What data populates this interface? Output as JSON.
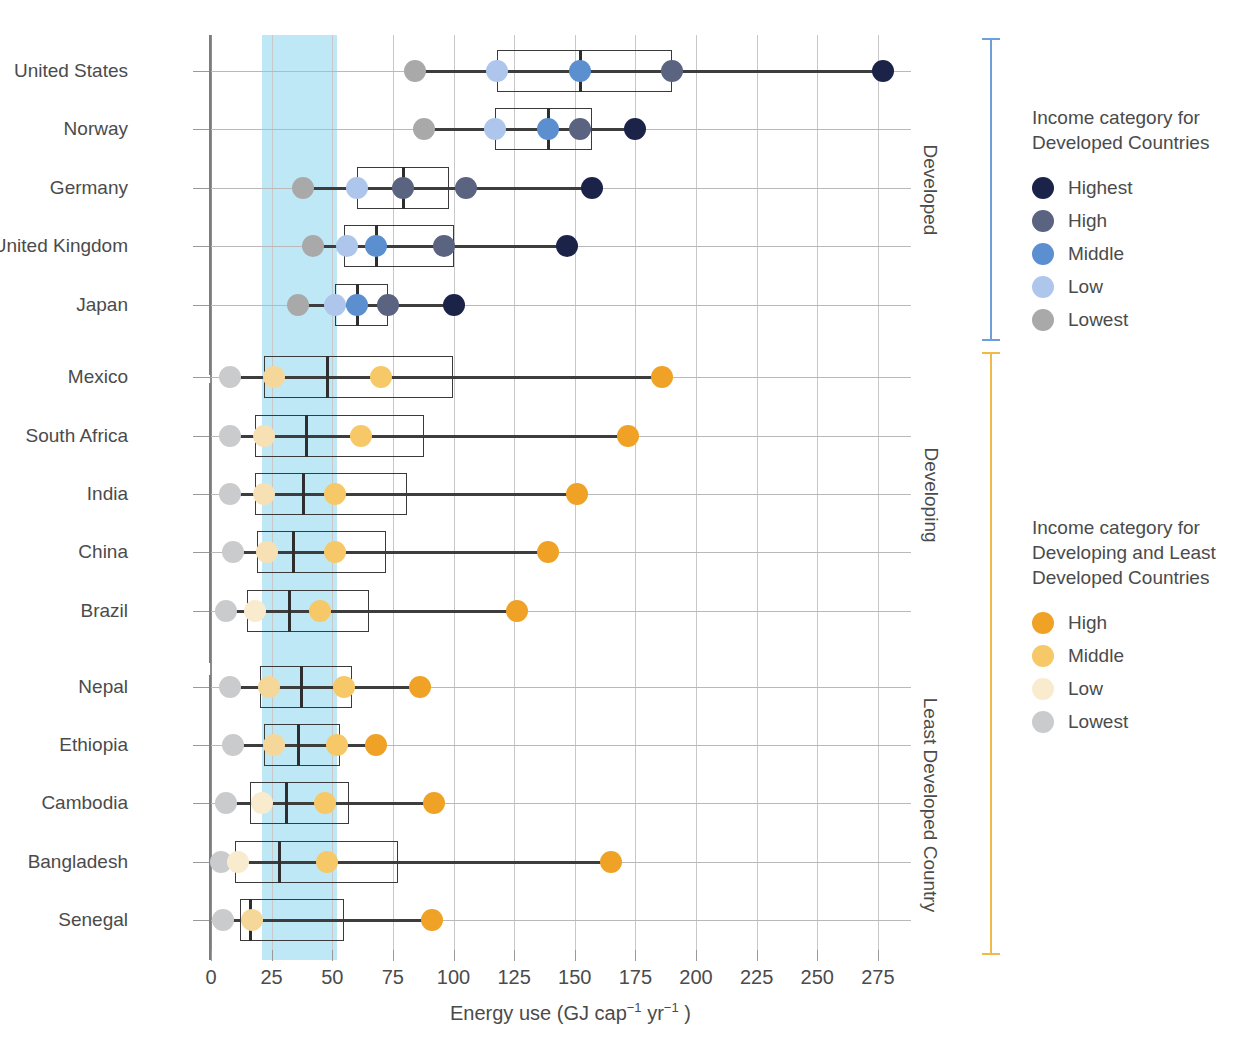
{
  "chart_data": {
    "type": "box",
    "title": "",
    "xlabel": "Energy use (GJ cap-1 yr-1 )",
    "xlabel_parts": {
      "pre": "Energy use (GJ cap",
      "sup1": "−1",
      "mid": " yr",
      "sup2": "−1",
      "post": " )"
    },
    "ylabel": "",
    "xlim": [
      0,
      285
    ],
    "xticks": [
      0,
      25,
      50,
      75,
      100,
      125,
      150,
      175,
      200,
      225,
      250,
      275
    ],
    "grid": "vertical",
    "decent_living_band": {
      "label": "",
      "min": 21,
      "max": 52,
      "color": "#bfe8f7"
    },
    "groups": [
      {
        "name": "Developed",
        "color": "#6f9fd8",
        "rows": [
          "United States",
          "Norway",
          "Germany",
          "United Kingdom",
          "Japan"
        ]
      },
      {
        "name": "Developing",
        "color": "#efb94e",
        "rows": [
          "Mexico",
          "South Africa",
          "India",
          "China",
          "Brazil"
        ]
      },
      {
        "name": "Least Developed Country",
        "color": "#efb94e",
        "rows": [
          "Nepal",
          "Ethiopia",
          "Cambodia",
          "Bangladesh",
          "Senegal"
        ]
      }
    ],
    "categories": [
      "United States",
      "Norway",
      "Germany",
      "United Kingdom",
      "Japan",
      "Mexico",
      "South Africa",
      "India",
      "China",
      "Brazil",
      "Nepal",
      "Ethiopia",
      "Cambodia",
      "Bangladesh",
      "Senegal"
    ],
    "rows": [
      {
        "country": "United States",
        "group": "Developed",
        "box": {
          "q1": 118,
          "median": 152,
          "q3": 190
        },
        "whisker": {
          "low": 84,
          "high": 277
        },
        "points": [
          {
            "category": "Lowest",
            "value": 84,
            "color": "#a9a9a9"
          },
          {
            "category": "Low",
            "value": 118,
            "color": "#aec6ec"
          },
          {
            "category": "Middle",
            "value": 152,
            "color": "#5b8fd0"
          },
          {
            "category": "High",
            "value": 190,
            "color": "#5a6480"
          },
          {
            "category": "Highest",
            "value": 277,
            "color": "#1b2349"
          }
        ]
      },
      {
        "country": "Norway",
        "group": "Developed",
        "box": {
          "q1": 117,
          "median": 139,
          "q3": 157
        },
        "whisker": {
          "low": 88,
          "high": 175
        },
        "points": [
          {
            "category": "Lowest",
            "value": 88,
            "color": "#a9a9a9"
          },
          {
            "category": "Low",
            "value": 117,
            "color": "#aec6ec"
          },
          {
            "category": "Middle",
            "value": 139,
            "color": "#5b8fd0"
          },
          {
            "category": "High",
            "value": 152,
            "color": "#5a6480"
          },
          {
            "category": "Highest",
            "value": 175,
            "color": "#1b2349"
          }
        ]
      },
      {
        "country": "Germany",
        "group": "Developed",
        "box": {
          "q1": 60,
          "median": 79,
          "q3": 98
        },
        "whisker": {
          "low": 38,
          "high": 157
        },
        "points": [
          {
            "category": "Lowest",
            "value": 38,
            "color": "#a9a9a9"
          },
          {
            "category": "Low",
            "value": 60,
            "color": "#aec6ec"
          },
          {
            "category": "Middle",
            "value": 79,
            "color": "#5a6480"
          },
          {
            "category": "High",
            "value": 105,
            "color": "#5a6480"
          },
          {
            "category": "Highest",
            "value": 157,
            "color": "#1b2349"
          }
        ]
      },
      {
        "country": "United Kingdom",
        "group": "Developed",
        "box": {
          "q1": 55,
          "median": 68,
          "q3": 100
        },
        "whisker": {
          "low": 42,
          "high": 147
        },
        "points": [
          {
            "category": "Lowest",
            "value": 42,
            "color": "#a9a9a9"
          },
          {
            "category": "Low",
            "value": 56,
            "color": "#aec6ec"
          },
          {
            "category": "Middle",
            "value": 68,
            "color": "#5b8fd0"
          },
          {
            "category": "High",
            "value": 96,
            "color": "#5a6480"
          },
          {
            "category": "Highest",
            "value": 147,
            "color": "#1b2349"
          }
        ]
      },
      {
        "country": "Japan",
        "group": "Developed",
        "box": {
          "q1": 51,
          "median": 60,
          "q3": 73
        },
        "whisker": {
          "low": 36,
          "high": 100
        },
        "points": [
          {
            "category": "Lowest",
            "value": 36,
            "color": "#a9a9a9"
          },
          {
            "category": "Low",
            "value": 51,
            "color": "#aec6ec"
          },
          {
            "category": "Middle",
            "value": 60,
            "color": "#5b8fd0"
          },
          {
            "category": "High",
            "value": 73,
            "color": "#5a6480"
          },
          {
            "category": "Highest",
            "value": 100,
            "color": "#1b2349"
          }
        ]
      },
      {
        "country": "Mexico",
        "group": "Developing",
        "box": {
          "q1": 22,
          "median": 48,
          "q3": 100
        },
        "whisker": {
          "low": 8,
          "high": 186
        },
        "points": [
          {
            "category": "Lowest",
            "value": 8,
            "color": "#c9cbcc"
          },
          {
            "category": "Low",
            "value": 26,
            "color": "#f6d79a"
          },
          {
            "category": "Middle",
            "value": 70,
            "color": "#f6c867"
          },
          {
            "category": "High",
            "value": 186,
            "color": "#efa226"
          }
        ]
      },
      {
        "country": "South Africa",
        "group": "Developing",
        "box": {
          "q1": 18,
          "median": 39,
          "q3": 88
        },
        "whisker": {
          "low": 8,
          "high": 172
        },
        "points": [
          {
            "category": "Lowest",
            "value": 8,
            "color": "#c9cbcc"
          },
          {
            "category": "Low",
            "value": 22,
            "color": "#f7e0b4"
          },
          {
            "category": "Middle",
            "value": 62,
            "color": "#f6c867"
          },
          {
            "category": "High",
            "value": 172,
            "color": "#efa226"
          }
        ]
      },
      {
        "country": "India",
        "group": "Developing",
        "box": {
          "q1": 18,
          "median": 38,
          "q3": 81
        },
        "whisker": {
          "low": 8,
          "high": 151
        },
        "points": [
          {
            "category": "Lowest",
            "value": 8,
            "color": "#c9cbcc"
          },
          {
            "category": "Low",
            "value": 22,
            "color": "#f7e0b4"
          },
          {
            "category": "Middle",
            "value": 51,
            "color": "#f6c867"
          },
          {
            "category": "High",
            "value": 151,
            "color": "#efa226"
          }
        ]
      },
      {
        "country": "China",
        "group": "Developing",
        "box": {
          "q1": 19,
          "median": 34,
          "q3": 72
        },
        "whisker": {
          "low": 9,
          "high": 139
        },
        "points": [
          {
            "category": "Lowest",
            "value": 9,
            "color": "#c9cbcc"
          },
          {
            "category": "Low",
            "value": 23,
            "color": "#f7e0b4"
          },
          {
            "category": "Middle",
            "value": 51,
            "color": "#f6c867"
          },
          {
            "category": "High",
            "value": 139,
            "color": "#efa226"
          }
        ]
      },
      {
        "country": "Brazil",
        "group": "Developing",
        "box": {
          "q1": 15,
          "median": 32,
          "q3": 65
        },
        "whisker": {
          "low": 6,
          "high": 126
        },
        "points": [
          {
            "category": "Lowest",
            "value": 6,
            "color": "#c9cbcc"
          },
          {
            "category": "Low",
            "value": 18,
            "color": "#f9ebcd"
          },
          {
            "category": "Middle",
            "value": 45,
            "color": "#f6c867"
          },
          {
            "category": "High",
            "value": 126,
            "color": "#efa226"
          }
        ]
      },
      {
        "country": "Nepal",
        "group": "Least Developed Country",
        "box": {
          "q1": 20,
          "median": 37,
          "q3": 58
        },
        "whisker": {
          "low": 8,
          "high": 86
        },
        "points": [
          {
            "category": "Lowest",
            "value": 8,
            "color": "#c9cbcc"
          },
          {
            "category": "Low",
            "value": 24,
            "color": "#f6d79a"
          },
          {
            "category": "Middle",
            "value": 55,
            "color": "#f6c867"
          },
          {
            "category": "High",
            "value": 86,
            "color": "#efa226"
          }
        ]
      },
      {
        "country": "Ethiopia",
        "group": "Least Developed Country",
        "box": {
          "q1": 22,
          "median": 36,
          "q3": 53
        },
        "whisker": {
          "low": 9,
          "high": 68
        },
        "points": [
          {
            "category": "Lowest",
            "value": 9,
            "color": "#c9cbcc"
          },
          {
            "category": "Low",
            "value": 26,
            "color": "#f6d79a"
          },
          {
            "category": "Middle",
            "value": 52,
            "color": "#f6c867"
          },
          {
            "category": "High",
            "value": 68,
            "color": "#efa226"
          }
        ]
      },
      {
        "country": "Cambodia",
        "group": "Least Developed Country",
        "box": {
          "q1": 16,
          "median": 31,
          "q3": 57
        },
        "whisker": {
          "low": 6,
          "high": 92
        },
        "points": [
          {
            "category": "Lowest",
            "value": 6,
            "color": "#c9cbcc"
          },
          {
            "category": "Low",
            "value": 21,
            "color": "#f9ebcd"
          },
          {
            "category": "Middle",
            "value": 47,
            "color": "#f6c867"
          },
          {
            "category": "High",
            "value": 92,
            "color": "#efa226"
          }
        ]
      },
      {
        "country": "Bangladesh",
        "group": "Least Developed Country",
        "box": {
          "q1": 10,
          "median": 28,
          "q3": 77
        },
        "whisker": {
          "low": 4,
          "high": 165
        },
        "points": [
          {
            "category": "Lowest",
            "value": 4,
            "color": "#c9cbcc"
          },
          {
            "category": "Low",
            "value": 11,
            "color": "#f9ebcd"
          },
          {
            "category": "Middle",
            "value": 48,
            "color": "#f6c867"
          },
          {
            "category": "High",
            "value": 165,
            "color": "#efa226"
          }
        ]
      },
      {
        "country": "Senegal",
        "group": "Least Developed Country",
        "box": {
          "q1": 12,
          "median": 16,
          "q3": 55
        },
        "whisker": {
          "low": 5,
          "high": 91
        },
        "points": [
          {
            "category": "Lowest",
            "value": 5,
            "color": "#c9cbcc"
          },
          {
            "category": "Low",
            "value": 17,
            "color": "#f6d79a"
          },
          {
            "category": "High",
            "value": 91,
            "color": "#efa226"
          }
        ]
      }
    ]
  },
  "legends": [
    {
      "id": "developed",
      "title": "Income category for Developed Countries",
      "title_lines": [
        "Income category for",
        "Developed Countries"
      ],
      "bracket_color": "#6f9fd8",
      "items": [
        {
          "label": "Highest",
          "color": "#1b2349"
        },
        {
          "label": "High",
          "color": "#5a6480"
        },
        {
          "label": "Middle",
          "color": "#5b8fd0"
        },
        {
          "label": "Low",
          "color": "#aec6ec"
        },
        {
          "label": "Lowest",
          "color": "#a9a9a9"
        }
      ]
    },
    {
      "id": "developing",
      "title": "Income category for Developing and Least Developed Countries",
      "title_lines": [
        "Income category for",
        "Developing and Least",
        "Developed Countries"
      ],
      "bracket_color": "#efb94e",
      "items": [
        {
          "label": "High",
          "color": "#efa226"
        },
        {
          "label": "Middle",
          "color": "#f6c867"
        },
        {
          "label": "Low",
          "color": "#f9ebcd"
        },
        {
          "label": "Lowest",
          "color": "#c9cbcc"
        }
      ]
    }
  ]
}
